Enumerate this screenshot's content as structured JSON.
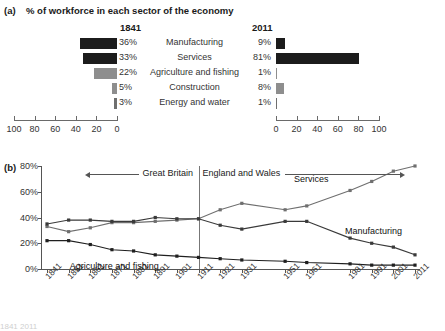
{
  "panel_a": {
    "fig_label": "(a)",
    "title": "% of workforce in each sector of the economy",
    "year_left": "1841",
    "year_right": "2011",
    "axis_left_ticks": [
      "100",
      "80",
      "60",
      "40",
      "20",
      "0"
    ],
    "axis_right_ticks": [
      "0",
      "20",
      "40",
      "60",
      "80",
      "100"
    ],
    "axis_max": 100,
    "rows": [
      {
        "sector": "Manufacturing",
        "left_pct_label": "36%",
        "left_value": 36,
        "right_pct_label": "9%",
        "right_value": 9,
        "color": "#1c1c1c"
      },
      {
        "sector": "Services",
        "left_pct_label": "33%",
        "left_value": 33,
        "right_pct_label": "81%",
        "right_value": 81,
        "color": "#1c1c1c"
      },
      {
        "sector": "Agriculture and fishing",
        "left_pct_label": "22%",
        "left_value": 22,
        "right_pct_label": "1%",
        "right_value": 1,
        "color": "#8e8e8e"
      },
      {
        "sector": "Construction",
        "left_pct_label": "5%",
        "left_value": 5,
        "right_pct_label": "8%",
        "right_value": 8,
        "color": "#8e8e8e"
      },
      {
        "sector": "Energy and water",
        "left_pct_label": "3%",
        "left_value": 3,
        "right_pct_label": "1%",
        "right_value": 1,
        "color": "#6f6f6f"
      }
    ]
  },
  "panel_b": {
    "fig_label": "(b)",
    "annotation_left": "Great Britain",
    "annotation_right": "England and Wales",
    "divider_year": "1911",
    "cutoff_text": "1841    2011"
  },
  "chart_data": {
    "type": "line",
    "title": "% of workforce in each sector of the economy",
    "xlabel": "",
    "ylabel": "",
    "ylim": [
      0,
      80
    ],
    "yticks": [
      0,
      20,
      40,
      60,
      80
    ],
    "ytick_labels": [
      "0%",
      "20%",
      "40%",
      "60%",
      "80%"
    ],
    "grid": false,
    "legend": "inline-labels",
    "x": [
      "1841",
      "1851",
      "1861",
      "1871",
      "1881",
      "1891",
      "1901",
      "1911",
      "1921",
      "1931",
      "1951",
      "1961",
      "1981",
      "1991",
      "2001",
      "2011"
    ],
    "series": [
      {
        "name": "Services",
        "color": "#6f6f6f",
        "values": [
          33,
          29,
          32,
          36,
          36,
          37,
          38,
          39,
          46,
          51,
          46,
          49,
          61,
          68,
          76,
          80
        ]
      },
      {
        "name": "Manufacturing",
        "color": "#3a3a3a",
        "values": [
          35,
          38,
          38,
          37,
          37,
          40,
          39,
          39,
          34,
          31,
          37,
          37,
          24,
          20,
          17,
          11
        ]
      },
      {
        "name": "Agriculture and fishing",
        "color": "#1f1f1f",
        "values": [
          22,
          22,
          19,
          15,
          14,
          11,
          10,
          9,
          8,
          7,
          6,
          5,
          4,
          3,
          3,
          3
        ]
      }
    ],
    "annotations": [
      {
        "text": "Great Britain",
        "x": "1841-1911"
      },
      {
        "text": "England and Wales",
        "x": "1911-2011"
      }
    ]
  }
}
